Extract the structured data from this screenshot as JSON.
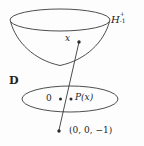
{
  "figure": {
    "stroke_color": "#3a3a3a",
    "text_color": "#232323",
    "background_color": "#fdfdfd",
    "labels": {
      "hyperboloid": {
        "base": "H",
        "superscript": "+",
        "subscript": "-1",
        "full": "H^+_{-1}"
      },
      "disk": "D",
      "origin": "0",
      "projected_point": "P(x)",
      "point": "x",
      "pole": "(0, 0, −1)"
    },
    "markers": [
      {
        "name": "origin-dot",
        "label": "0",
        "x": 60,
        "y": 99
      },
      {
        "name": "projected-point-dot",
        "label": "P(x)",
        "x": 71,
        "y": 99
      },
      {
        "name": "point-x-dot",
        "label": "x",
        "x": 78,
        "y": 42
      },
      {
        "name": "pole-dot",
        "label": "(0, 0, −1)",
        "x": 59,
        "y": 131
      }
    ],
    "shapes": {
      "hyperboloid_rim": {
        "cx": 60,
        "cy": 20,
        "rx": 50,
        "ry": 11
      },
      "disk_ellipse": {
        "cx": 70,
        "cy": 99,
        "rx": 48,
        "ry": 13
      },
      "projection_line": {
        "x1": 59,
        "y1": 131,
        "x2": 79,
        "y2": 41
      }
    }
  }
}
